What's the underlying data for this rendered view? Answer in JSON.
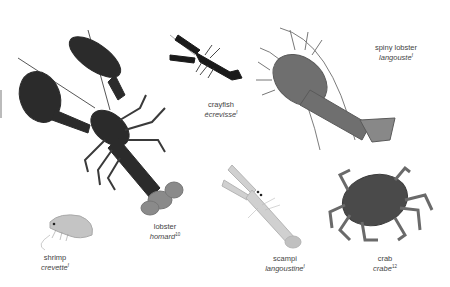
{
  "figure": {
    "items": [
      {
        "id": "lobster",
        "en": "lobster",
        "fr": "homard",
        "ref": "10"
      },
      {
        "id": "crayfish",
        "en": "crayfish",
        "fr": "écrevisse",
        "ref": "f"
      },
      {
        "id": "spiny-lobster",
        "en": "spiny lobster",
        "fr": "langouste",
        "ref": "f"
      },
      {
        "id": "shrimp",
        "en": "shrimp",
        "fr": "crevette",
        "ref": "f"
      },
      {
        "id": "scampi",
        "en": "scampi",
        "fr": "langoustine",
        "ref": "f"
      },
      {
        "id": "crab",
        "en": "crab",
        "fr": "crabe",
        "ref": "12"
      }
    ]
  },
  "colors": {
    "lobster": "#2b2b2b",
    "crayfish": "#1a1a1a",
    "spiny_lobster": "#6f6f6f",
    "shrimp": "#bdbdbd",
    "scampi": "#c8c8c8",
    "crab": "#4a4a4a",
    "label_text": "#444444"
  }
}
